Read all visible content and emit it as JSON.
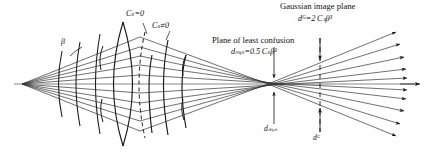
{
  "figure": {
    "type": "optical-ray-diagram",
    "background_color": "#ffffff",
    "line_color": "#1a1a1a"
  },
  "labels": {
    "cs_zero": "Cₛ=0",
    "cs_nonzero": "Cₛ≠0",
    "beta": "β",
    "gaussian_image_plane": "Gaussian image plane",
    "d_gauss_formula": "dᴳ=2 Cₛβ³",
    "plane_of_least_confusion": "Plane of least confusion",
    "d_min_formula": "dₘᵢₙ=0.5 Cₛβ³",
    "d_min_marker": "dₘᵢₙ",
    "d_gauss_marker": "dᴳ"
  },
  "label_parts": {
    "cs_zero": {
      "symbol": "C",
      "subscript": "s",
      "relation": "=0"
    },
    "cs_nonzero": {
      "symbol": "C",
      "subscript": "s",
      "relation": "≠0"
    },
    "d_gauss": {
      "symbol": "d",
      "subscript": "G",
      "equals": "=2",
      "coeff": "C",
      "coeff_sub": "s",
      "angle": "β",
      "power": "3"
    },
    "d_min": {
      "symbol": "d",
      "subscript": "min",
      "equals": "=0.5",
      "coeff": "C",
      "coeff_sub": "s",
      "angle": "β",
      "power": "3"
    }
  },
  "geometry": {
    "source_point": {
      "x": 22,
      "y": 84
    },
    "least_confusion_x": 274,
    "gaussian_plane_x": 320,
    "axis_y": 84,
    "ray_count": 8,
    "wavefront_count": 5
  }
}
